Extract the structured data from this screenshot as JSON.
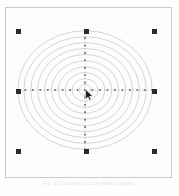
{
  "app": {
    "window_title": "Drawing Canvas",
    "caption": "Fig. 1  Concentric  circle  field  diagram"
  },
  "canvas": {
    "background_color": "#fdfdfd",
    "border_color": "#c9c9c9",
    "frame": {
      "x": 5,
      "y": 7,
      "width": 167,
      "height": 171
    }
  },
  "shape": {
    "name": "concentric-circles",
    "type": "bullseye",
    "center": {
      "x": 85,
      "y": 90
    },
    "stroke_color": "#b9b6c4",
    "stroke_width": 0.6,
    "fill": "none",
    "ring_count": 10,
    "radii_x": [
      6,
      13,
      20,
      27,
      34,
      41,
      48,
      55,
      62,
      68
    ],
    "radii_y": [
      5.5,
      11.5,
      17.5,
      23.5,
      29.5,
      36,
      42,
      48,
      54,
      60
    ]
  },
  "guides": {
    "horizontal": {
      "name": "horizontal-axis-guide",
      "y": 90,
      "x_start": 17,
      "x_end": 153,
      "color": "#8d8d96",
      "node_count": 19
    },
    "vertical": {
      "name": "vertical-axis-guide",
      "x": 85,
      "y_start": 30,
      "y_end": 150,
      "color": "#8d8d96",
      "node_count": 17
    }
  },
  "selection": {
    "label": "Selected object",
    "handle_color": "#2b2b2b",
    "handle_size": 5,
    "handles": [
      {
        "name": "handle-top-left",
        "x": 17,
        "y": 30
      },
      {
        "name": "handle-top-center",
        "x": 85,
        "y": 30
      },
      {
        "name": "handle-top-right",
        "x": 153,
        "y": 30
      },
      {
        "name": "handle-middle-left",
        "x": 17,
        "y": 90
      },
      {
        "name": "handle-middle-right",
        "x": 153,
        "y": 90
      },
      {
        "name": "handle-bottom-left",
        "x": 17,
        "y": 150
      },
      {
        "name": "handle-bottom-center",
        "x": 85,
        "y": 150
      },
      {
        "name": "handle-bottom-right",
        "x": 153,
        "y": 150
      }
    ]
  },
  "cursor": {
    "name": "arrow-cursor",
    "x": 84,
    "y": 88,
    "color": "#1a1a1a"
  }
}
